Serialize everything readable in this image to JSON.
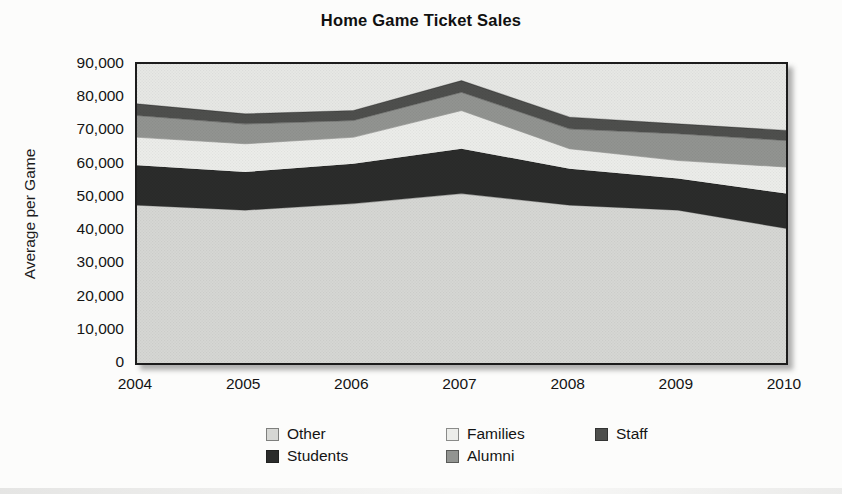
{
  "title": "Home Game Ticket Sales",
  "y_axis": {
    "label": "Average per Game",
    "ticks": [
      "90,000",
      "80,000",
      "70,000",
      "60,000",
      "50,000",
      "40,000",
      "30,000",
      "20,000",
      "10,000",
      "0"
    ]
  },
  "x_axis": {
    "ticks": [
      "2004",
      "2005",
      "2006",
      "2007",
      "2008",
      "2009",
      "2010"
    ]
  },
  "legend": {
    "items": [
      {
        "label": "Other",
        "color": "#d6d7d4"
      },
      {
        "label": "Families",
        "color": "#ecedea"
      },
      {
        "label": "Staff",
        "color": "#4e4f4d"
      },
      {
        "label": "Students",
        "color": "#2b2c2b"
      },
      {
        "label": "Alumni",
        "color": "#929491"
      }
    ]
  },
  "colors": {
    "plot_background": "#e7e8e5",
    "plot_border": "#1c1c1c",
    "page_background": "#fcfcfb"
  },
  "chart_data": {
    "type": "area",
    "stacked": true,
    "title": "Home Game Ticket Sales",
    "xlabel": "",
    "ylabel": "Average per Game",
    "x": [
      2004,
      2005,
      2006,
      2007,
      2008,
      2009,
      2010
    ],
    "ylim": [
      0,
      90000
    ],
    "ytick_step": 10000,
    "grid": false,
    "legend_position": "bottom",
    "series": [
      {
        "name": "Other",
        "color": "#d6d7d4",
        "values": [
          47500,
          46000,
          48000,
          51000,
          47500,
          46000,
          40500
        ]
      },
      {
        "name": "Students",
        "color": "#2b2c2b",
        "values": [
          12000,
          11500,
          12000,
          13500,
          11000,
          9500,
          10500
        ]
      },
      {
        "name": "Families",
        "color": "#ecedea",
        "values": [
          8500,
          8500,
          8000,
          11500,
          6000,
          5500,
          8000
        ]
      },
      {
        "name": "Alumni",
        "color": "#929491",
        "values": [
          6500,
          6000,
          5000,
          5500,
          6000,
          8000,
          8000
        ]
      },
      {
        "name": "Staff",
        "color": "#4e4f4d",
        "values": [
          3500,
          3000,
          3000,
          3500,
          3500,
          3000,
          3000
        ]
      }
    ],
    "stacked_totals": [
      78000,
      75000,
      76000,
      85000,
      74000,
      72000,
      70000
    ]
  }
}
